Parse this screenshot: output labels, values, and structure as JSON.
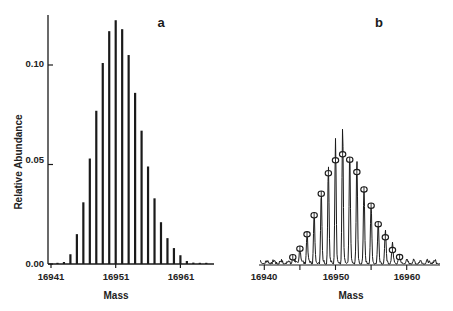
{
  "chart_data": [
    {
      "panel": "a",
      "type": "bar",
      "title": "a",
      "xlabel": "Mass",
      "ylabel": "Relative Abundance",
      "xticks": [
        16941,
        16951,
        16961
      ],
      "xtick_labels": [
        "16941",
        "16951",
        "16961"
      ],
      "yticks": [
        0.0,
        0.05,
        0.1
      ],
      "ytick_labels": [
        "0.00",
        "0.05",
        "0.10"
      ],
      "xlim": [
        16940.5,
        16966
      ],
      "ylim": [
        0,
        0.124
      ],
      "grid": false,
      "x": [
        16942,
        16943,
        16944,
        16945,
        16946,
        16947,
        16948,
        16949,
        16950,
        16951,
        16952,
        16953,
        16954,
        16955,
        16956,
        16957,
        16958,
        16959,
        16960,
        16961,
        16962,
        16963,
        16964,
        16965
      ],
      "values": [
        0.0005,
        0.001,
        0.0049,
        0.015,
        0.031,
        0.053,
        0.077,
        0.101,
        0.117,
        0.1225,
        0.118,
        0.105,
        0.086,
        0.067,
        0.049,
        0.033,
        0.021,
        0.013,
        0.008,
        0.0044,
        0.0015,
        0.0007,
        0.0004,
        0.0002
      ]
    },
    {
      "panel": "b",
      "type": "line",
      "title": "b",
      "xlabel": "Mass",
      "ylabel": "",
      "xticks": [
        16940,
        16945,
        16950,
        16955,
        16960
      ],
      "xtick_labels": [
        "16940",
        "",
        "16950",
        "",
        "16960"
      ],
      "xlim": [
        16939.5,
        16965
      ],
      "grid": false,
      "y_units": "relative (same vertical scale as panel a)",
      "series": [
        {
          "name": "Measured spectrum (peaks)",
          "style": "line",
          "x": [
            16944,
            16945,
            16946,
            16947,
            16948,
            16949,
            16950,
            16951,
            16952,
            16953,
            16954,
            16955,
            16956,
            16957,
            16958,
            16959
          ],
          "values": [
            0.0034,
            0.0085,
            0.015,
            0.0245,
            0.0353,
            0.0487,
            0.0628,
            0.0678,
            0.0543,
            0.0513,
            0.0375,
            0.0293,
            0.02,
            0.0156,
            0.0096,
            0.0035
          ]
        },
        {
          "name": "Theoretical distribution (circles)",
          "style": "open-circle markers",
          "x": [
            16944,
            16945,
            16946,
            16947,
            16948,
            16949,
            16950,
            16951,
            16952,
            16953,
            16954,
            16955,
            16956,
            16957,
            16958,
            16959
          ],
          "values": [
            0.0034,
            0.0077,
            0.0149,
            0.0245,
            0.0353,
            0.0456,
            0.0521,
            0.0551,
            0.0524,
            0.0462,
            0.0375,
            0.0293,
            0.02,
            0.0134,
            0.007,
            0.0035
          ]
        }
      ]
    }
  ],
  "labels": {
    "panel_a": "a",
    "panel_b": "b",
    "ylabel_a": "Relative Abundance",
    "xlabel_a": "Mass",
    "xlabel_b": "Mass",
    "ytick_0": "0.00",
    "ytick_1": "0.05",
    "ytick_2": "0.10",
    "xtick_a_0": "16941",
    "xtick_a_1": "16951",
    "xtick_a_2": "16961",
    "xtick_b_0": "16940",
    "xtick_b_1": "16950",
    "xtick_b_2": "16960"
  },
  "colors": {
    "ink": "#1a1a1a",
    "background": "#ffffff"
  }
}
